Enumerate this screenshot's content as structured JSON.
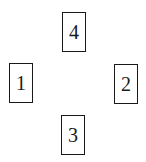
{
  "diagram": {
    "boxes": [
      {
        "label": "4",
        "position": "top"
      },
      {
        "label": "1",
        "position": "left"
      },
      {
        "label": "2",
        "position": "right"
      },
      {
        "label": "3",
        "position": "bottom"
      }
    ]
  },
  "colors": {
    "border": "#1a1a1a",
    "text": "#1a1a1a",
    "background": "#ffffff"
  }
}
